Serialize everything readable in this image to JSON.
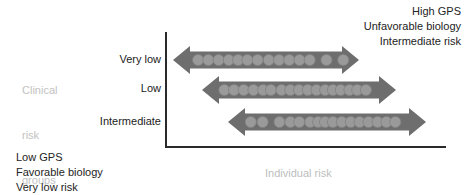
{
  "figure": {
    "background": "#ffffff",
    "axis_color": "#2a2a2a",
    "arrow_body_color": "#6e6e6e",
    "arrow_dot_color": "#9a9a9a",
    "muted_text_color": "#bdbdbd",
    "text_color": "#232323"
  },
  "notes": {
    "top_right": {
      "line1": "High GPS",
      "line2": "Unfavorable biology",
      "line3": "Intermediate risk"
    },
    "bottom_left": {
      "line1": "Low GPS",
      "line2": "Favorable biology",
      "line3": "Very low risk"
    }
  },
  "axes": {
    "y_title_line1": "Clinical",
    "y_title_line2": "risk",
    "y_title_line3": "groups",
    "x_title": "Individual risk"
  },
  "chart_data": {
    "type": "bar",
    "title": "",
    "subtitle": "",
    "xlabel": "Individual risk",
    "ylabel": "Clinical risk groups",
    "grid": false,
    "legend_position": "none",
    "annotations": [
      "High GPS",
      "Unfavorable biology",
      "Intermediate risk",
      "Low GPS",
      "Favorable biology",
      "Very low risk"
    ],
    "categories": [
      "Very low",
      "Low",
      "Intermediate"
    ],
    "xlim": [
      0,
      100
    ],
    "series": [
      {
        "name": "Individual risk range",
        "ranges": [
          {
            "category": "Very low",
            "start": 4,
            "end": 69
          },
          {
            "category": "Low",
            "start": 13,
            "end": 82
          },
          {
            "category": "Intermediate",
            "start": 22,
            "end": 93
          }
        ]
      }
    ],
    "points": {
      "Very low": [
        8,
        12,
        16,
        20,
        23,
        26,
        30,
        34,
        38,
        42,
        46,
        51,
        58,
        66
      ],
      "Low": [
        17,
        21,
        25,
        29,
        33,
        36,
        41,
        45,
        49,
        53,
        57,
        61,
        64,
        68,
        72,
        75,
        79
      ],
      "Intermediate": [
        26,
        31,
        38,
        43,
        47,
        52,
        56,
        59,
        63,
        67,
        71,
        75,
        79,
        83,
        87,
        90
      ]
    }
  },
  "categories": [
    {
      "label": "Very low",
      "top": 53
    },
    {
      "label": "Low",
      "top": 82
    },
    {
      "label": "Intermediate",
      "top": 115
    }
  ],
  "arrows": [
    {
      "name": "arrow-very-low",
      "category": "Very low",
      "left": 173,
      "top": 46,
      "width": 186,
      "height": 28,
      "dots": [
        0.135,
        0.19,
        0.245,
        0.3,
        0.35,
        0.4,
        0.455,
        0.515,
        0.57,
        0.625,
        0.68,
        0.735,
        0.825,
        0.915
      ]
    },
    {
      "name": "arrow-low",
      "category": "Low",
      "left": 202,
      "top": 76,
      "width": 194,
      "height": 28,
      "dots": [
        0.115,
        0.165,
        0.215,
        0.265,
        0.315,
        0.355,
        0.41,
        0.455,
        0.5,
        0.545,
        0.59,
        0.635,
        0.675,
        0.715,
        0.76,
        0.8,
        0.845
      ]
    },
    {
      "name": "arrow-intermediate",
      "category": "Intermediate",
      "left": 228,
      "top": 108,
      "width": 198,
      "height": 28,
      "dots": [
        0.115,
        0.175,
        0.26,
        0.315,
        0.36,
        0.415,
        0.455,
        0.49,
        0.53,
        0.575,
        0.62,
        0.665,
        0.71,
        0.755,
        0.8,
        0.845
      ]
    }
  ]
}
